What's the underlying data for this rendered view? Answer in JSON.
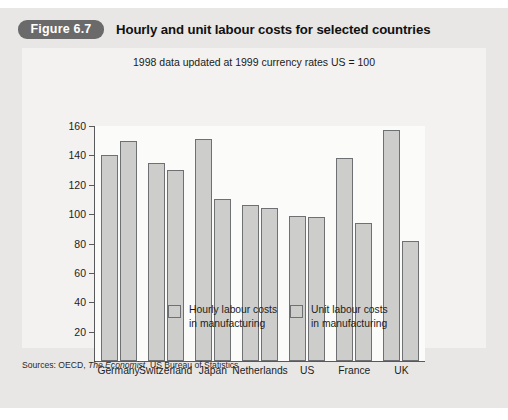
{
  "figure": {
    "badge_label": "Figure 6.7",
    "title": "Hourly and unit labour costs for selected countries"
  },
  "source": {
    "prefix": "Sources: OECD,",
    "italic": "The Economist",
    "suffix": ", US Bureau of Statistics"
  },
  "chart_data": {
    "type": "bar",
    "title": "Hourly and unit labour costs for selected countries",
    "subtitle": "1998 data updated at 1999 currency rates US = 100",
    "xlabel": "",
    "ylabel": "",
    "ylim": [
      0,
      160
    ],
    "yticks": [
      20,
      40,
      60,
      80,
      100,
      120,
      140,
      160
    ],
    "ytick_labels": [
      "20",
      "40",
      "60",
      "80",
      "100",
      "120",
      "140",
      "160"
    ],
    "grid": false,
    "legend_position": "bottom",
    "categories": [
      "Germany",
      "Switzerland",
      "Japan",
      "Netherlands",
      "US",
      "France",
      "UK"
    ],
    "series": [
      {
        "name": "Hourly labour costs in manufacturing",
        "legend_line1": "Hourly labour costs",
        "legend_line2": "in manufacturing",
        "color": "#cdcdcb",
        "values": [
          140,
          135,
          151,
          106,
          99,
          138,
          157
        ]
      },
      {
        "name": "Unit labour costs in manufacturing",
        "legend_line1": "Unit labour costs",
        "legend_line2": "in manufacturing",
        "color": "#cdcdcb",
        "values": [
          150,
          130,
          110,
          104,
          98,
          94,
          82
        ]
      }
    ]
  }
}
